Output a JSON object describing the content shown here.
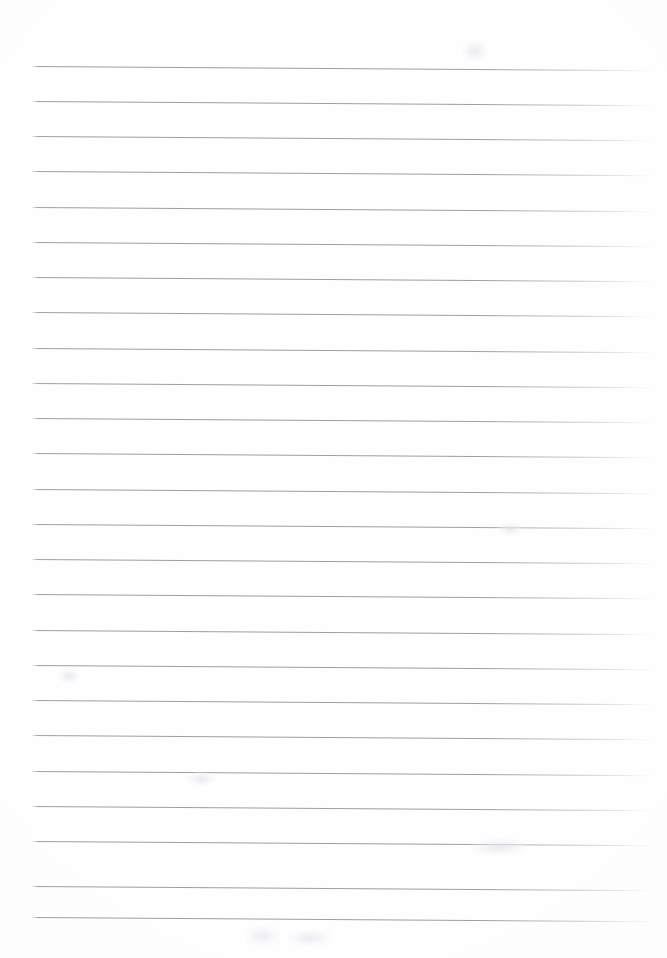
{
  "document": {
    "kind": "ruled-notebook-page",
    "title": "Blank lined notebook page",
    "page_width": 667,
    "page_height": 958,
    "background_color": "#fefefe",
    "written_content": "",
    "is_blank": true
  },
  "ruling": {
    "line_color": "#96969c",
    "line_thickness_px": 1,
    "line_spacing_px": 35.4,
    "first_line_y": 66,
    "line_start_x": 32,
    "line_end_x": 656,
    "slant_degrees": 0.38,
    "line_count": 25,
    "lines": [
      {
        "index": 1,
        "y": 66
      },
      {
        "index": 2,
        "y": 101
      },
      {
        "index": 3,
        "y": 136
      },
      {
        "index": 4,
        "y": 171
      },
      {
        "index": 5,
        "y": 207
      },
      {
        "index": 6,
        "y": 242
      },
      {
        "index": 7,
        "y": 277
      },
      {
        "index": 8,
        "y": 312
      },
      {
        "index": 9,
        "y": 348
      },
      {
        "index": 10,
        "y": 383
      },
      {
        "index": 11,
        "y": 418
      },
      {
        "index": 12,
        "y": 453
      },
      {
        "index": 13,
        "y": 489
      },
      {
        "index": 14,
        "y": 524
      },
      {
        "index": 15,
        "y": 559
      },
      {
        "index": 16,
        "y": 594
      },
      {
        "index": 17,
        "y": 630
      },
      {
        "index": 18,
        "y": 665
      },
      {
        "index": 19,
        "y": 700
      },
      {
        "index": 20,
        "y": 735
      },
      {
        "index": 21,
        "y": 771
      },
      {
        "index": 22,
        "y": 806
      },
      {
        "index": 23,
        "y": 841
      },
      {
        "index": 24,
        "y": 886
      },
      {
        "index": 25,
        "y": 917
      }
    ]
  },
  "margins": {
    "top_margin_px": 66,
    "bottom_margin_px": 41,
    "left_margin_px": 32,
    "right_margin_px": 11
  },
  "smudges": [
    {
      "name": "smudge-upper-right",
      "x": 462,
      "y": 40,
      "width": 26,
      "height": 22,
      "style": "smudge-a"
    },
    {
      "name": "smudge-left-mid",
      "x": 58,
      "y": 668,
      "width": 22,
      "height": 16,
      "style": "smudge-a"
    },
    {
      "name": "smudge-right-mid",
      "x": 498,
      "y": 522,
      "width": 24,
      "height": 14,
      "style": "smudge-a"
    },
    {
      "name": "smudge-bottom-one",
      "x": 246,
      "y": 926,
      "width": 34,
      "height": 20,
      "style": "smudge-b"
    },
    {
      "name": "smudge-bottom-two",
      "x": 288,
      "y": 930,
      "width": 44,
      "height": 16,
      "style": "smudge-b"
    },
    {
      "name": "smudge-bottom-right",
      "x": 470,
      "y": 838,
      "width": 58,
      "height": 18,
      "style": "smudge-a"
    },
    {
      "name": "smudge-top-faint",
      "x": 186,
      "y": 772,
      "width": 30,
      "height": 14,
      "style": "smudge-a"
    }
  ]
}
